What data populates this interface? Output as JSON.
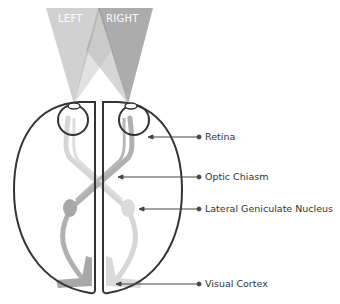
{
  "diagram": {
    "type": "visual-pathway",
    "fields": [
      {
        "label": "LEFT",
        "color": "#c4c4c4"
      },
      {
        "label": "RIGHT",
        "color": "#9a9a9a"
      }
    ],
    "labels": [
      {
        "id": "retina",
        "text": "Retina"
      },
      {
        "id": "optic-chiasm",
        "text": "Optic Chiasm"
      },
      {
        "id": "lgn",
        "text": "Lateral Geniculate Nucleus"
      },
      {
        "id": "visual-cortex",
        "text": "Visual Cortex"
      }
    ],
    "colors": {
      "outline": "#333333",
      "pathway_dark": "#a8a8a8",
      "pathway_light": "#d4d4d4",
      "leader": "#444444"
    }
  }
}
